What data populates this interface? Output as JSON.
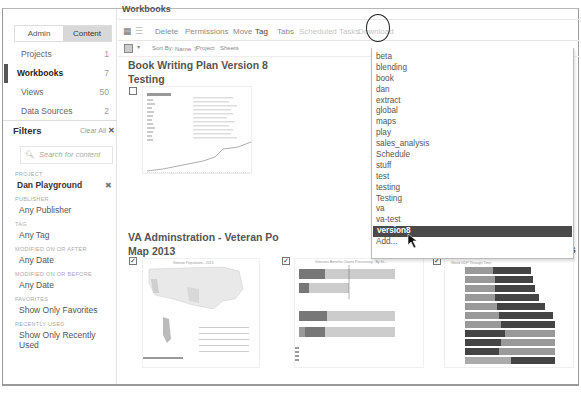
{
  "sidebar": {
    "segments": [
      {
        "label": "Admin",
        "active": false
      },
      {
        "label": "Content",
        "active": true
      }
    ],
    "nav": [
      {
        "label": "Projects",
        "count": "1",
        "active": false
      },
      {
        "label": "Workbooks",
        "count": "7",
        "active": true
      },
      {
        "label": "Views",
        "count": "50",
        "active": false
      },
      {
        "label": "Data Sources",
        "count": "2",
        "active": false
      }
    ],
    "filters": {
      "title": "Filters",
      "clear_all": "Clear All",
      "search_placeholder": "Search for content",
      "groups": [
        {
          "label": "PROJECT",
          "value": "Dan Playground",
          "removable": true
        },
        {
          "label": "PUBLISHER",
          "value": "Any Publisher"
        },
        {
          "label": "TAG",
          "value": "Any Tag"
        },
        {
          "label": "MODIFIED ON OR AFTER",
          "value": "Any Date"
        },
        {
          "label": "MODIFIED ON OR BEFORE",
          "value": "Any Date"
        },
        {
          "label": "FAVORITES",
          "value": "Show Only Favorites"
        },
        {
          "label": "RECENTLY USED",
          "value": "Show Only Recently Used"
        }
      ]
    }
  },
  "main": {
    "title": "Workbooks",
    "toolbar": {
      "delete": "Delete",
      "permissions": "Permissions",
      "move": "Move",
      "tag": "Tag",
      "tabs": "Tabs",
      "scheduled_tasks": "Scheduled Tasks",
      "download": "Download"
    },
    "sortbar": {
      "sort_by": "Sort By:",
      "name": "Name ⇧",
      "project": "Project",
      "sheets": "Sheets"
    },
    "cards": [
      {
        "title_line1": "Book Writing Plan Version 8",
        "title_line2": "Testing",
        "checked": false
      },
      {
        "title_line1": "Layout Example",
        "title_line2": "",
        "checked": false
      },
      {
        "title_line1": "VA Adminstration - Veteran Po",
        "title_line2": "Map 2013",
        "checked": true
      },
      {
        "title_line1": "",
        "title_line2": "",
        "checked": true
      },
      {
        "title_line1": "Bank DGM V8 Examples",
        "title_line2": "",
        "checked": true
      }
    ],
    "thumb_captions": {
      "va_map": "Veteran Population - 2013",
      "benefits": "Veterans Benefits Claims Processing - By St...",
      "gdp": "World GDP Through Time"
    }
  },
  "tag_dropdown": {
    "items": [
      "beta",
      "blending",
      "book",
      "dan",
      "extract",
      "global",
      "maps",
      "play",
      "sales_analysis",
      "Schedule",
      "stuff",
      "test",
      "testing",
      "Testing",
      "va",
      "va-test",
      "version8"
    ],
    "selected": "version8",
    "add_label": "Add..."
  }
}
